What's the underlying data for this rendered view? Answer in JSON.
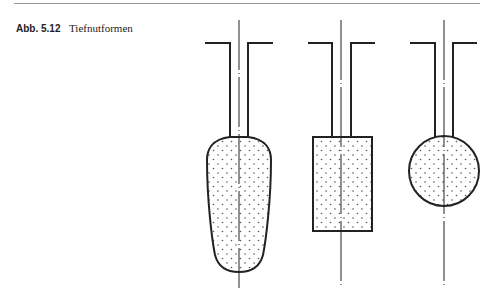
{
  "figure": {
    "label": "Abb. 5.12",
    "title": "Tiefnutformen",
    "shapes": [
      {
        "name": "tropfen",
        "description": "drop / pear-shaped deep slot"
      },
      {
        "name": "rechteck",
        "description": "rectangular deep slot"
      },
      {
        "name": "kreis",
        "description": "round deep slot"
      }
    ]
  },
  "colors": {
    "line": "#222222",
    "rule": "#9a9a9a",
    "dots": "#555555"
  }
}
